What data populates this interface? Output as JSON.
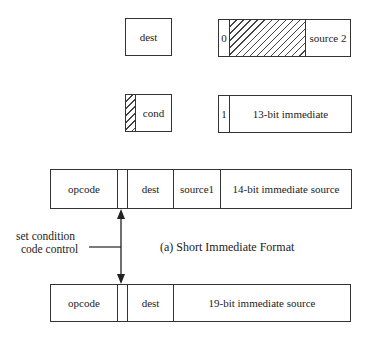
{
  "diagram": {
    "caption": "(a) Short Immediate Format",
    "annotation": {
      "line1": "set condition",
      "line2": "code control"
    },
    "top_fields": {
      "dest_box": {
        "label": "dest"
      },
      "source2_box": {
        "tag": "0",
        "hatched": true,
        "label": "source 2"
      },
      "cond_box": {
        "label": "cond",
        "hatched_prefix": true
      },
      "imm13_box": {
        "tag": "1",
        "label": "13-bit immediate"
      }
    },
    "format_short": {
      "fields": [
        {
          "label": "opcode"
        },
        {
          "label": ""
        },
        {
          "label": "dest"
        },
        {
          "label": "source1"
        },
        {
          "label": "14-bit immediate source"
        }
      ]
    },
    "format_long": {
      "fields": [
        {
          "label": "opcode"
        },
        {
          "label": ""
        },
        {
          "label": "dest"
        },
        {
          "label": "19-bit immediate source"
        }
      ]
    }
  }
}
